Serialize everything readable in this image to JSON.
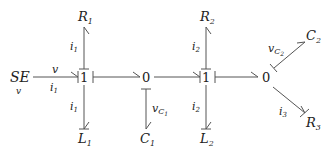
{
  "diagram": {
    "type": "bond-graph",
    "nodes": {
      "source": {
        "label": "SE",
        "sub": "v"
      },
      "junction1a": {
        "label": "1"
      },
      "junction0a": {
        "label": "0"
      },
      "junction1b": {
        "label": "1"
      },
      "junction0b": {
        "label": "0"
      },
      "R1": {
        "label": "R",
        "sub": "1"
      },
      "L1": {
        "label": "L",
        "sub": "1"
      },
      "C1": {
        "label": "C",
        "sub": "1"
      },
      "R2": {
        "label": "R",
        "sub": "2"
      },
      "L2": {
        "label": "L",
        "sub": "2"
      },
      "C2": {
        "label": "C",
        "sub": "2"
      },
      "R3": {
        "label": "R",
        "sub": "3"
      }
    },
    "bond_labels": {
      "se_effort": "v",
      "se_flow": "i",
      "se_flow_sub": "1",
      "r1_flow": "i",
      "r1_flow_sub": "1",
      "l1_flow": "i",
      "l1_flow_sub": "1",
      "c1_effort": "v",
      "c1_effort_sub": "C",
      "c1_effort_subsub": "1",
      "r2_flow": "i",
      "r2_flow_sub": "2",
      "l2_flow": "i",
      "l2_flow_sub": "2",
      "c2_effort": "v",
      "c2_effort_sub": "C",
      "c2_effort_subsub": "2",
      "r3_flow": "i",
      "r3_flow_sub": "3"
    }
  }
}
